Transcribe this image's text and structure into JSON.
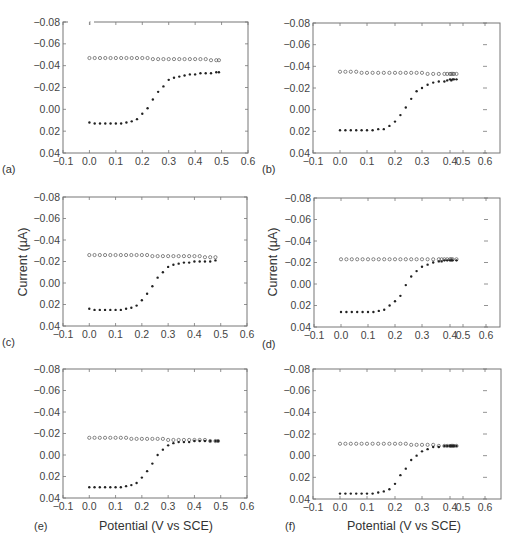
{
  "figure": {
    "ylabel": "Current (µA)",
    "xlabel": "Potential (V vs SCE)"
  },
  "chart_data": [
    {
      "type": "scatter",
      "panel": "(a)",
      "xlabel": "",
      "ylabel": "",
      "xlim": [
        -0.1,
        0.6
      ],
      "ylim": [
        -0.08,
        0.04
      ],
      "y_inverted": true,
      "xticks": [
        "-0.1",
        "0.0",
        "0.1",
        "0.2",
        "0.3",
        "0.4",
        "0.5",
        "0.6"
      ],
      "yticks": [
        "-0.08",
        "-0.06",
        "-0.04",
        "-0.02",
        "0.00",
        "0.02",
        "0.04"
      ],
      "grid": false,
      "box": {
        "x": 63,
        "y": 22,
        "w": 185,
        "h": 131
      },
      "series": [
        {
          "name": "open-circles",
          "marker": "open-circle",
          "x": [
            0.0,
            0.02,
            0.04,
            0.06,
            0.08,
            0.1,
            0.12,
            0.14,
            0.16,
            0.18,
            0.2,
            0.22,
            0.24,
            0.26,
            0.28,
            0.3,
            0.32,
            0.34,
            0.36,
            0.38,
            0.4,
            0.42,
            0.44,
            0.46,
            0.48,
            0.49
          ],
          "values": [
            -0.047,
            -0.047,
            -0.047,
            -0.047,
            -0.047,
            -0.047,
            -0.047,
            -0.047,
            -0.047,
            -0.047,
            -0.047,
            -0.047,
            -0.046,
            -0.046,
            -0.046,
            -0.046,
            -0.046,
            -0.046,
            -0.046,
            -0.046,
            -0.046,
            -0.046,
            -0.046,
            -0.045,
            -0.045,
            -0.045
          ]
        },
        {
          "name": "filled-dots",
          "marker": "filled-dot",
          "x": [
            0.0,
            0.02,
            0.04,
            0.06,
            0.08,
            0.1,
            0.12,
            0.14,
            0.16,
            0.18,
            0.2,
            0.22,
            0.24,
            0.26,
            0.28,
            0.3,
            0.32,
            0.34,
            0.36,
            0.38,
            0.4,
            0.42,
            0.44,
            0.46,
            0.48,
            0.49
          ],
          "values": [
            0.012,
            0.013,
            0.013,
            0.013,
            0.013,
            0.013,
            0.013,
            0.012,
            0.011,
            0.009,
            0.004,
            -0.001,
            -0.009,
            -0.016,
            -0.021,
            -0.027,
            -0.029,
            -0.03,
            -0.031,
            -0.032,
            -0.032,
            -0.033,
            -0.033,
            -0.033,
            -0.034,
            -0.034
          ]
        }
      ]
    },
    {
      "type": "scatter",
      "panel": "(b)",
      "xlabel": "",
      "ylabel": "",
      "xlim": [
        -0.1,
        0.6
      ],
      "ylim": [
        -0.08,
        0.04
      ],
      "y_inverted": true,
      "xticks": [
        "-0.1",
        "0.0",
        "0.1",
        "0.2",
        "0.3",
        "0.4",
        "0.5",
        "0.6"
      ],
      "xtick_pos": [
        313,
        340,
        367,
        395,
        422,
        450,
        463,
        485
      ],
      "yticks": [
        "-0.08",
        "-0.06",
        "-0.04",
        "-0.02",
        "0.00",
        "0.02",
        "0.04"
      ],
      "grid": false,
      "box": {
        "x": 313,
        "y": 23,
        "w": 187,
        "h": 130
      },
      "series": [
        {
          "name": "open-circles",
          "marker": "open-circle",
          "x": [
            0.0,
            0.02,
            0.04,
            0.06,
            0.08,
            0.1,
            0.12,
            0.14,
            0.16,
            0.18,
            0.2,
            0.22,
            0.24,
            0.26,
            0.28,
            0.3,
            0.32,
            0.34,
            0.36,
            0.38,
            0.39,
            0.4,
            0.41,
            0.42,
            0.43,
            0.45
          ],
          "values": [
            -0.035,
            -0.035,
            -0.035,
            -0.035,
            -0.034,
            -0.034,
            -0.034,
            -0.034,
            -0.034,
            -0.034,
            -0.034,
            -0.034,
            -0.034,
            -0.034,
            -0.034,
            -0.034,
            -0.033,
            -0.033,
            -0.033,
            -0.033,
            -0.033,
            -0.033,
            -0.033,
            -0.033,
            -0.033,
            -0.033
          ]
        },
        {
          "name": "filled-dots",
          "marker": "filled-dot",
          "x": [
            0.0,
            0.02,
            0.04,
            0.06,
            0.08,
            0.1,
            0.12,
            0.14,
            0.16,
            0.18,
            0.2,
            0.22,
            0.24,
            0.26,
            0.28,
            0.3,
            0.32,
            0.34,
            0.36,
            0.38,
            0.39,
            0.4,
            0.41,
            0.42,
            0.43,
            0.45
          ],
          "values": [
            0.019,
            0.019,
            0.019,
            0.019,
            0.019,
            0.019,
            0.019,
            0.018,
            0.018,
            0.015,
            0.011,
            0.005,
            -0.002,
            -0.01,
            -0.017,
            -0.02,
            -0.023,
            -0.025,
            -0.026,
            -0.026,
            -0.027,
            -0.028,
            -0.027,
            -0.028,
            -0.028,
            -0.028
          ]
        }
      ]
    },
    {
      "type": "scatter",
      "panel": "(c)",
      "xlabel": "",
      "ylabel": "Current (µA)",
      "xlim": [
        -0.1,
        0.6
      ],
      "ylim": [
        -0.08,
        0.04
      ],
      "y_inverted": true,
      "xticks": [
        "-0.1",
        "0.0",
        "0.1",
        "0.2",
        "0.3",
        "0.4",
        "0.5",
        "0.6"
      ],
      "yticks": [
        "-0.08",
        "-0.06",
        "-0.04",
        "-0.02",
        "0.00",
        "0.02",
        "0.04"
      ],
      "grid": false,
      "box": {
        "x": 63,
        "y": 197,
        "w": 184,
        "h": 129
      },
      "series": [
        {
          "name": "open-circles",
          "marker": "open-circle",
          "x": [
            0.0,
            0.02,
            0.04,
            0.06,
            0.08,
            0.1,
            0.12,
            0.14,
            0.16,
            0.18,
            0.2,
            0.22,
            0.24,
            0.26,
            0.28,
            0.3,
            0.32,
            0.34,
            0.36,
            0.38,
            0.4,
            0.42,
            0.44,
            0.46,
            0.48
          ],
          "values": [
            -0.026,
            -0.026,
            -0.026,
            -0.026,
            -0.026,
            -0.026,
            -0.026,
            -0.026,
            -0.026,
            -0.026,
            -0.026,
            -0.026,
            -0.025,
            -0.025,
            -0.025,
            -0.025,
            -0.025,
            -0.025,
            -0.025,
            -0.025,
            -0.025,
            -0.025,
            -0.024,
            -0.024,
            -0.024
          ]
        },
        {
          "name": "filled-dots",
          "marker": "filled-dot",
          "x": [
            0.0,
            0.02,
            0.04,
            0.06,
            0.08,
            0.1,
            0.12,
            0.14,
            0.16,
            0.18,
            0.2,
            0.22,
            0.24,
            0.26,
            0.28,
            0.3,
            0.32,
            0.34,
            0.36,
            0.38,
            0.4,
            0.42,
            0.44,
            0.46,
            0.48
          ],
          "values": [
            0.024,
            0.025,
            0.025,
            0.025,
            0.025,
            0.025,
            0.025,
            0.024,
            0.023,
            0.021,
            0.016,
            0.01,
            0.003,
            -0.005,
            -0.01,
            -0.015,
            -0.017,
            -0.018,
            -0.019,
            -0.019,
            -0.02,
            -0.02,
            -0.02,
            -0.02,
            -0.021
          ]
        }
      ]
    },
    {
      "type": "scatter",
      "panel": "(d)",
      "xlabel": "",
      "ylabel": "Current (µA)",
      "xlim": [
        -0.1,
        0.6
      ],
      "ylim": [
        -0.08,
        0.04
      ],
      "y_inverted": true,
      "xticks": [
        "-0.1",
        "0.0",
        "0.1",
        "0.2",
        "0.3",
        "0.4",
        "0.5",
        "0.6"
      ],
      "xtick_pos": [
        314,
        341,
        368,
        395,
        422,
        450,
        463,
        486
      ],
      "yticks": [
        "-0.08",
        "-0.06",
        "-0.04",
        "-0.02",
        "0.00",
        "0.02",
        "0.04"
      ],
      "grid": false,
      "box": {
        "x": 314,
        "y": 198,
        "w": 186,
        "h": 129
      },
      "series": [
        {
          "name": "open-circles",
          "marker": "open-circle",
          "x": [
            0.0,
            0.02,
            0.04,
            0.06,
            0.08,
            0.1,
            0.12,
            0.14,
            0.16,
            0.18,
            0.2,
            0.22,
            0.24,
            0.26,
            0.28,
            0.3,
            0.32,
            0.34,
            0.36,
            0.37,
            0.38,
            0.39,
            0.4,
            0.41,
            0.42,
            0.45
          ],
          "values": [
            -0.023,
            -0.023,
            -0.023,
            -0.023,
            -0.023,
            -0.023,
            -0.023,
            -0.023,
            -0.023,
            -0.023,
            -0.023,
            -0.023,
            -0.023,
            -0.023,
            -0.023,
            -0.023,
            -0.023,
            -0.023,
            -0.023,
            -0.023,
            -0.023,
            -0.023,
            -0.023,
            -0.023,
            -0.023,
            -0.023
          ]
        },
        {
          "name": "filled-dots",
          "marker": "filled-dot",
          "x": [
            0.0,
            0.02,
            0.04,
            0.06,
            0.08,
            0.1,
            0.12,
            0.14,
            0.16,
            0.18,
            0.2,
            0.22,
            0.24,
            0.26,
            0.28,
            0.3,
            0.32,
            0.34,
            0.36,
            0.37,
            0.38,
            0.39,
            0.4,
            0.41,
            0.42,
            0.45
          ],
          "values": [
            0.026,
            0.026,
            0.026,
            0.026,
            0.026,
            0.026,
            0.026,
            0.025,
            0.024,
            0.02,
            0.016,
            0.011,
            0.001,
            -0.007,
            -0.012,
            -0.016,
            -0.018,
            -0.02,
            -0.021,
            -0.021,
            -0.022,
            -0.022,
            -0.022,
            -0.022,
            -0.022,
            -0.022
          ]
        }
      ]
    },
    {
      "type": "scatter",
      "panel": "(e)",
      "xlabel": "Potential (V vs SCE)",
      "ylabel": "",
      "xlim": [
        -0.1,
        0.6
      ],
      "ylim": [
        -0.08,
        0.04
      ],
      "y_inverted": true,
      "xticks": [
        "-0.1",
        "0.0",
        "0.1",
        "0.2",
        "0.3",
        "0.4",
        "0.5",
        "0.6"
      ],
      "yticks": [
        "-0.08",
        "-0.06",
        "-0.04",
        "-0.02",
        "0.00",
        "0.02",
        "0.04"
      ],
      "grid": false,
      "box": {
        "x": 63,
        "y": 369,
        "w": 184,
        "h": 129
      },
      "series": [
        {
          "name": "open-circles",
          "marker": "open-circle",
          "x": [
            0.0,
            0.02,
            0.04,
            0.06,
            0.08,
            0.1,
            0.12,
            0.14,
            0.16,
            0.18,
            0.2,
            0.22,
            0.24,
            0.26,
            0.28,
            0.3,
            0.32,
            0.34,
            0.36,
            0.38,
            0.4,
            0.42,
            0.44,
            0.46,
            0.48,
            0.49
          ],
          "values": [
            -0.016,
            -0.016,
            -0.016,
            -0.016,
            -0.016,
            -0.016,
            -0.016,
            -0.016,
            -0.015,
            -0.015,
            -0.015,
            -0.015,
            -0.015,
            -0.015,
            -0.015,
            -0.014,
            -0.014,
            -0.014,
            -0.014,
            -0.014,
            -0.014,
            -0.014,
            -0.014,
            -0.013,
            -0.013,
            -0.013
          ]
        },
        {
          "name": "filled-dots",
          "marker": "filled-dot",
          "x": [
            0.0,
            0.02,
            0.04,
            0.06,
            0.08,
            0.1,
            0.12,
            0.14,
            0.16,
            0.18,
            0.2,
            0.22,
            0.24,
            0.26,
            0.28,
            0.3,
            0.32,
            0.34,
            0.36,
            0.38,
            0.4,
            0.42,
            0.44,
            0.46,
            0.48,
            0.49
          ],
          "values": [
            0.03,
            0.03,
            0.03,
            0.03,
            0.03,
            0.03,
            0.03,
            0.029,
            0.028,
            0.026,
            0.021,
            0.015,
            0.008,
            0.0,
            -0.005,
            -0.009,
            -0.011,
            -0.012,
            -0.012,
            -0.012,
            -0.013,
            -0.013,
            -0.013,
            -0.013,
            -0.013,
            -0.013
          ]
        }
      ]
    },
    {
      "type": "scatter",
      "panel": "(f)",
      "xlabel": "Potential (V vs SCE)",
      "ylabel": "",
      "xlim": [
        -0.1,
        0.6
      ],
      "ylim": [
        -0.08,
        0.04
      ],
      "y_inverted": true,
      "xticks": [
        "-0.1",
        "0.0",
        "0.1",
        "0.2",
        "0.3",
        "0.4",
        "0.5",
        "0.6"
      ],
      "xtick_pos": [
        313,
        340,
        367,
        395,
        422,
        450,
        463,
        485
      ],
      "yticks": [
        "-0.08",
        "-0.06",
        "-0.04",
        "-0.02",
        "0.00",
        "0.02",
        "0.04"
      ],
      "grid": false,
      "box": {
        "x": 313,
        "y": 369,
        "w": 188,
        "h": 130
      },
      "series": [
        {
          "name": "open-circles",
          "marker": "open-circle",
          "x": [
            0.0,
            0.02,
            0.04,
            0.06,
            0.08,
            0.1,
            0.12,
            0.14,
            0.16,
            0.18,
            0.2,
            0.22,
            0.24,
            0.26,
            0.28,
            0.3,
            0.32,
            0.34,
            0.36,
            0.38,
            0.39,
            0.4,
            0.41,
            0.42,
            0.43,
            0.45
          ],
          "values": [
            -0.011,
            -0.011,
            -0.011,
            -0.011,
            -0.011,
            -0.011,
            -0.011,
            -0.011,
            -0.011,
            -0.011,
            -0.011,
            -0.011,
            -0.011,
            -0.01,
            -0.01,
            -0.01,
            -0.01,
            -0.01,
            -0.009,
            -0.009,
            -0.009,
            -0.009,
            -0.009,
            -0.009,
            -0.009,
            -0.009
          ]
        },
        {
          "name": "filled-dots",
          "marker": "filled-dot",
          "x": [
            0.0,
            0.02,
            0.04,
            0.06,
            0.08,
            0.1,
            0.12,
            0.14,
            0.16,
            0.18,
            0.2,
            0.22,
            0.24,
            0.26,
            0.28,
            0.3,
            0.32,
            0.34,
            0.36,
            0.38,
            0.39,
            0.4,
            0.41,
            0.42,
            0.43,
            0.45
          ],
          "values": [
            0.035,
            0.035,
            0.035,
            0.035,
            0.035,
            0.035,
            0.035,
            0.034,
            0.033,
            0.031,
            0.026,
            0.018,
            0.012,
            0.004,
            0.0,
            -0.004,
            -0.006,
            -0.008,
            -0.008,
            -0.009,
            -0.009,
            -0.009,
            -0.009,
            -0.009,
            -0.009,
            -0.009
          ]
        }
      ]
    }
  ]
}
